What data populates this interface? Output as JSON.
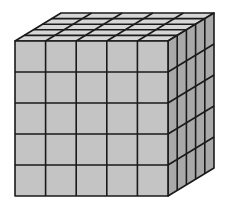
{
  "diagram": {
    "type": "cube-of-unit-cubes",
    "grid": {
      "rows": 5,
      "cols": 5,
      "depth": 5
    },
    "colors": {
      "background": "#ffffff",
      "front_face": "#c4c4c4",
      "top_face": "#d6d6d6",
      "right_face": "#a9a9a9",
      "edge": "#1a1a1a"
    },
    "geometry": {
      "front": {
        "x0": 15,
        "y0": 41,
        "x1": 168,
        "y1": 196
      },
      "offset": {
        "dx": 46,
        "dy": -28
      }
    }
  }
}
